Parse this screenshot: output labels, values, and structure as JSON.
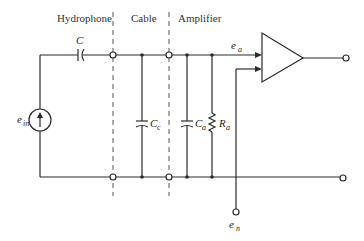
{
  "sections": {
    "hydrophone": "Hydrophone",
    "cable": "Cable",
    "amplifier": "Amplifier"
  },
  "components": {
    "series_capacitor": {
      "symbol": "C",
      "sub": ""
    },
    "cable_capacitor": {
      "symbol": "C",
      "sub": "c"
    },
    "amp_capacitor": {
      "symbol": "C",
      "sub": "a"
    },
    "amp_resistor": {
      "symbol": "R",
      "sub": "a"
    },
    "source": {
      "symbol": "e",
      "sub": "in"
    },
    "amp_input_voltage": {
      "symbol": "e",
      "sub": "a"
    },
    "noise_source": {
      "symbol": "e",
      "sub": "n"
    }
  },
  "colors": {
    "line": "#2a2a2a",
    "background": "#ffffff"
  }
}
